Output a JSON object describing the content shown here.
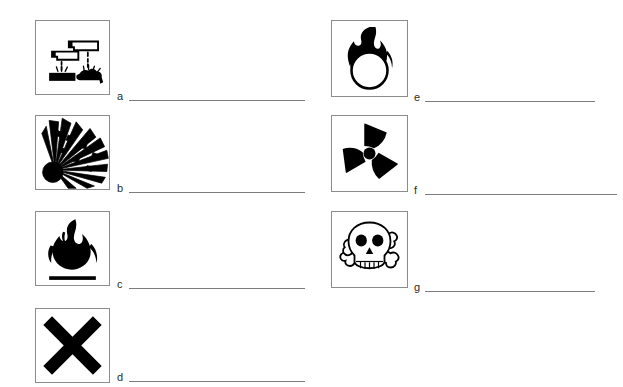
{
  "document": {
    "type": "worksheet",
    "title": "Hazard Symbols Identification Worksheet",
    "background_color": "#ffffff",
    "box_border_color": "#8c8c8c",
    "line_color": "#7d7d7d",
    "symbol_color": "#000000"
  },
  "items": [
    {
      "letter": "a",
      "icon": "corrosive-icon",
      "icon_description": "Corrosive: liquid dripping from two test tubes onto a hand and a surface",
      "answer": ""
    },
    {
      "letter": "b",
      "icon": "explosive-icon",
      "icon_description": "Explosive: exploding bomb with radiating fragments",
      "answer": ""
    },
    {
      "letter": "c",
      "icon": "flammable-icon",
      "icon_description": "Flammable: flame above a baseline",
      "answer": ""
    },
    {
      "letter": "d",
      "icon": "irritant-harmful-icon",
      "icon_description": "Harmful or irritant: bold saltire cross",
      "answer": ""
    },
    {
      "letter": "e",
      "icon": "oxidizing-icon",
      "icon_description": "Oxidizing: flame over a circle",
      "answer": ""
    },
    {
      "letter": "f",
      "icon": "radioactive-icon",
      "icon_description": "Radioactive: trefoil with three blades and centre dot",
      "answer": ""
    },
    {
      "letter": "g",
      "icon": "toxic-icon",
      "icon_description": "Toxic: skull and crossbones",
      "answer": ""
    }
  ]
}
